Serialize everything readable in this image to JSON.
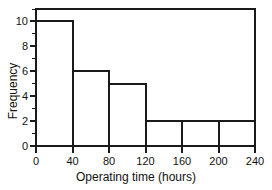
{
  "chart_data": {
    "type": "bar",
    "subtype": "histogram",
    "title": "",
    "subtitle": "",
    "xlabel": "Operating time (hours)",
    "ylabel": "Frequency",
    "categories": [
      "0-40",
      "40-80",
      "80-120",
      "120-160",
      "160-200",
      "200-240"
    ],
    "bin_edges": [
      0,
      40,
      80,
      120,
      160,
      200,
      240
    ],
    "bin_width": 40,
    "values": [
      10,
      6,
      5,
      2,
      2,
      2
    ],
    "bars": [
      {
        "label": "0-40",
        "x_start": 0,
        "x_end": 40,
        "value": 10
      },
      {
        "label": "40-80",
        "x_start": 40,
        "x_end": 80,
        "value": 6
      },
      {
        "label": "80-120",
        "x_start": 80,
        "x_end": 120,
        "value": 5
      },
      {
        "label": "120-160",
        "x_start": 120,
        "x_end": 160,
        "value": 2
      },
      {
        "label": "160-200",
        "x_start": 160,
        "x_end": 200,
        "value": 2
      },
      {
        "label": "200-240",
        "x_start": 200,
        "x_end": 240,
        "value": 2
      }
    ],
    "xlim": [
      0,
      240
    ],
    "ylim": [
      0,
      11
    ],
    "xticks": [
      0,
      40,
      80,
      120,
      160,
      200,
      240
    ],
    "xtick_labels": [
      "0",
      "40",
      "80",
      "120",
      "160",
      "200",
      "240"
    ],
    "yticks": [
      0,
      2,
      4,
      6,
      8,
      10
    ],
    "ytick_labels": [
      "0",
      "2",
      "4",
      "6",
      "8",
      "10"
    ],
    "yticks_minor": [
      1,
      3,
      5,
      7,
      9,
      11
    ],
    "grid": false,
    "legend": null,
    "legend_position": "none",
    "colors": {
      "line": "#1a1a1a",
      "fill": "none",
      "background": "#ffffff",
      "text": "#111111"
    },
    "annotations": []
  }
}
